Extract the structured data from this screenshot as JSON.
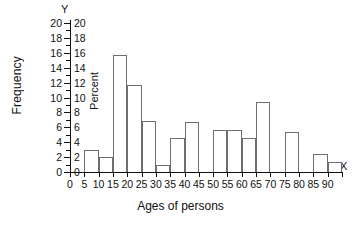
{
  "chart_data": {
    "type": "bar",
    "title": "",
    "subtitle": "",
    "xlabel": "Ages of persons",
    "ylabel": "Frequency",
    "secondary_ylabel": "Percent",
    "x_axis_letter": "X",
    "y_axis_letter": "Y",
    "xlim": [
      0,
      95
    ],
    "ylim": [
      0,
      20
    ],
    "grid": false,
    "legend": "none",
    "bin_width": 5,
    "x_tick_labels": [
      "0",
      "5",
      "10",
      "15",
      "20",
      "25",
      "30",
      "35",
      "40",
      "45",
      "50",
      "55",
      "60",
      "65",
      "70",
      "75",
      "80",
      "85",
      "90"
    ],
    "x_tick_values": [
      0,
      5,
      10,
      15,
      20,
      25,
      30,
      35,
      40,
      45,
      50,
      55,
      60,
      65,
      70,
      75,
      80,
      85,
      90
    ],
    "y_tick_labels": [
      "0",
      "2",
      "4",
      "6",
      "8",
      "10",
      "12",
      "14",
      "16",
      "18",
      "20"
    ],
    "y_tick_values": [
      0,
      2,
      4,
      6,
      8,
      10,
      12,
      14,
      16,
      18,
      20
    ],
    "y_tick_labels_secondary": [
      "0",
      "2",
      "4",
      "6",
      "8",
      "10",
      "12",
      "14",
      "16",
      "18",
      "20"
    ],
    "categories": [
      "0-5",
      "5-10",
      "10-15",
      "15-20",
      "20-25",
      "25-30",
      "30-35",
      "35-40",
      "40-45",
      "45-50",
      "50-55",
      "55-60",
      "60-65",
      "65-70",
      "70-75",
      "75-80",
      "80-85",
      "85-90",
      "90-95"
    ],
    "bin_starts": [
      0,
      5,
      10,
      15,
      20,
      25,
      30,
      35,
      40,
      45,
      50,
      55,
      60,
      65,
      70,
      75,
      80,
      85,
      90
    ],
    "values": [
      0,
      3,
      2,
      15.7,
      11.7,
      6.9,
      0.9,
      4.6,
      6.7,
      0,
      5.7,
      5.6,
      4.5,
      9.4,
      0,
      5.4,
      0,
      2.4,
      1.4
    ]
  }
}
